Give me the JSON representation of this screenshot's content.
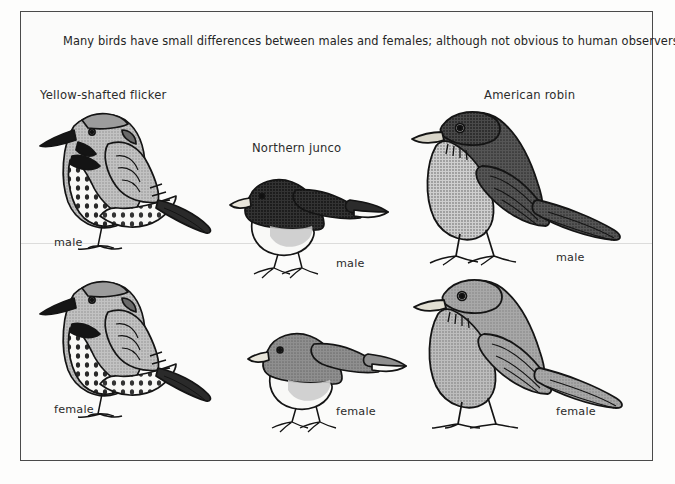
{
  "figure": {
    "caption": "Many birds have small differences between males and females; although not obvious to human observers, these differences are important signals between birds.",
    "border_color": "#4a4a4a",
    "background_color": "#fbfbfa",
    "ink_color": "#2b2b2b"
  },
  "species": [
    {
      "name": "Yellow-shafted flicker"
    },
    {
      "name": "Northern junco"
    },
    {
      "name": "American robin"
    }
  ],
  "sex_labels": {
    "male": "male",
    "female": "female"
  },
  "specimens": [
    {
      "species": "Yellow-shafted flicker",
      "sex": "male",
      "body_tone": "#b9b9b9"
    },
    {
      "species": "Yellow-shafted flicker",
      "sex": "female",
      "body_tone": "#b9b9b9"
    },
    {
      "species": "Northern junco",
      "sex": "male",
      "body_tone": "#3a3a3a"
    },
    {
      "species": "Northern junco",
      "sex": "female",
      "body_tone": "#8d8d8d"
    },
    {
      "species": "American robin",
      "sex": "male",
      "body_tone": "#585858"
    },
    {
      "species": "American robin",
      "sex": "female",
      "body_tone": "#9d9d9d"
    }
  ]
}
